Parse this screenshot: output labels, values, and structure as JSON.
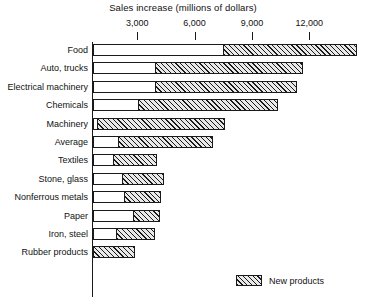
{
  "chart_data": {
    "type": "bar",
    "orientation": "horizontal",
    "stacked": true,
    "title": "Sales increase (millions of dollars)",
    "xlabel": "Sales increase (millions of dollars)",
    "ylabel": "",
    "xlim": [
      0,
      15000
    ],
    "xticks": [
      3000,
      6000,
      9000,
      12000
    ],
    "xtick_labels": [
      "3,000",
      "6,000",
      "9,000",
      "12,000"
    ],
    "grid": false,
    "legend": [
      "New products"
    ],
    "legend_position": "bottom-right",
    "categories": [
      "Food",
      "Auto,  trucks",
      "Electrical machinery",
      "Chemicals",
      "Machinery",
      "Average",
      "Textiles",
      "Stone, glass",
      "Nonferrous metals",
      "Paper",
      "Iron, steel",
      "Rubber products"
    ],
    "series": [
      {
        "name": "Existing products",
        "hatched": false,
        "values": [
          7500,
          3900,
          3900,
          3000,
          900,
          2000,
          1050,
          1550,
          1650,
          2100,
          1200,
          700
        ]
      },
      {
        "name": "New products",
        "hatched": true,
        "values": [
          7000,
          7750,
          7450,
          7350,
          6700,
          4950,
          2300,
          2200,
          1950,
          1400,
          2050,
          1500
        ]
      }
    ],
    "totals": [
      14500,
      11650,
      11350,
      10350,
      7600,
      6950,
      3350,
      3750,
      3600,
      3500,
      3250,
      2200
    ],
    "bar_pixel_geometry": {
      "axis_x_px": 93,
      "value_zero_px": 80,
      "px_per_3000": 57.3,
      "bars": [
        {
          "category": "Food",
          "split_px": 223,
          "end_px": 357
        },
        {
          "category": "Auto,  trucks",
          "split_px": 155,
          "end_px": 303
        },
        {
          "category": "Electrical machinery",
          "split_px": 155,
          "end_px": 297
        },
        {
          "category": "Chemicals",
          "split_px": 138,
          "end_px": 278
        },
        {
          "category": "Machinery",
          "split_px": 97,
          "end_px": 225
        },
        {
          "category": "Average",
          "split_px": 118,
          "end_px": 213
        },
        {
          "category": "Textiles",
          "split_px": 113,
          "end_px": 157
        },
        {
          "category": "Stone, glass",
          "split_px": 122,
          "end_px": 164
        },
        {
          "category": "Nonferrous metals",
          "split_px": 124,
          "end_px": 161
        },
        {
          "category": "Paper",
          "split_px": 133,
          "end_px": 160
        },
        {
          "category": "Iron, steel",
          "split_px": 116,
          "end_px": 155
        },
        {
          "category": "Rubber products",
          "split_px": 93,
          "end_px": 135
        }
      ]
    }
  },
  "legend": {
    "new_products_label": "New products"
  }
}
